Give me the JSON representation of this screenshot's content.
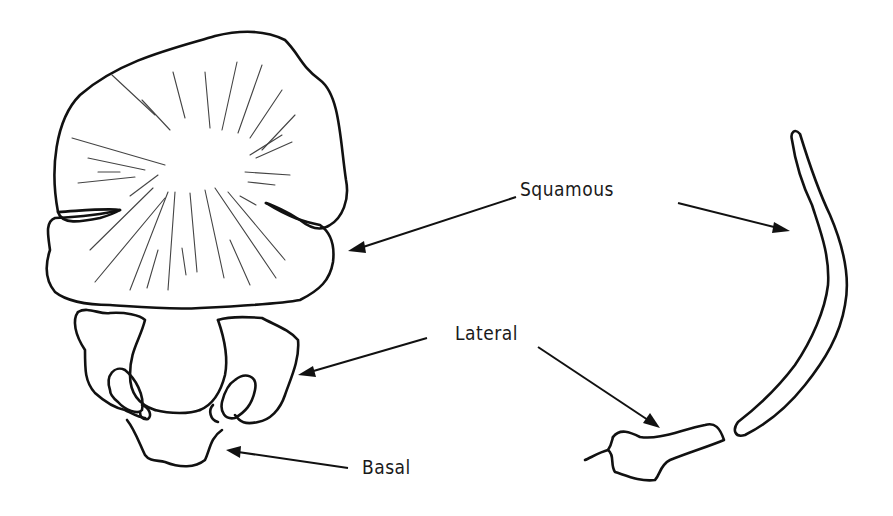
{
  "figure": {
    "labels": {
      "squamous": "Squamous",
      "lateral": "Lateral",
      "basal": "Basal"
    },
    "colors": {
      "line": "#111111",
      "background": "#ffffff"
    }
  }
}
